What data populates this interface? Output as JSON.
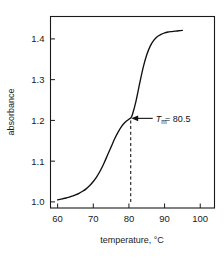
{
  "chart_data": {
    "type": "line",
    "title": "",
    "xlabel": "temperature, °C",
    "ylabel": "absorbance",
    "xlim": [
      58,
      104
    ],
    "ylim": [
      0.985,
      1.455
    ],
    "xticks": [
      "60",
      "70",
      "80",
      "90",
      "100"
    ],
    "xtick_values": [
      60,
      70,
      80,
      90,
      100
    ],
    "yticks": [
      "1.0",
      "1.1",
      "1.2",
      "1.3",
      "1.4"
    ],
    "ytick_values": [
      1.0,
      1.1,
      1.2,
      1.3,
      1.4
    ],
    "grid": false,
    "legend": "none",
    "series": [
      {
        "name": "melting curve",
        "x": [
          60.0,
          61.0,
          62.0,
          63.0,
          64.0,
          65.0,
          66.0,
          67.0,
          68.0,
          69.0,
          70.0,
          71.0,
          72.0,
          73.0,
          74.0,
          75.0,
          76.0,
          77.0,
          78.0,
          79.0,
          80.0,
          80.5,
          81.0,
          82.0,
          83.0,
          84.0,
          85.0,
          86.0,
          87.0,
          88.0,
          89.0,
          90.0,
          91.0,
          92.0,
          93.0,
          94.0,
          95.0
        ],
        "y": [
          1.005,
          1.007,
          1.009,
          1.011,
          1.014,
          1.017,
          1.021,
          1.026,
          1.032,
          1.04,
          1.05,
          1.062,
          1.077,
          1.095,
          1.115,
          1.135,
          1.155,
          1.172,
          1.186,
          1.196,
          1.203,
          1.206,
          1.215,
          1.248,
          1.29,
          1.33,
          1.361,
          1.383,
          1.397,
          1.406,
          1.411,
          1.415,
          1.417,
          1.418,
          1.419,
          1.42,
          1.421
        ]
      }
    ],
    "annotations": [
      {
        "name": "tm-annotation",
        "symbol": "T",
        "subscript": "m",
        "equals": " = 80.5",
        "text": "Tₘ = 80.5",
        "x": 80.5,
        "y": 1.205,
        "marker": "left-arrow",
        "dashed_dropline": true,
        "dropline_from_y": 1.0,
        "dropline_to_y": 1.205
      }
    ]
  }
}
